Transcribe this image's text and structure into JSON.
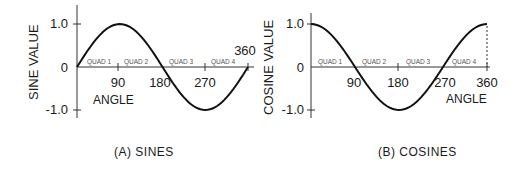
{
  "chart_data": [
    {
      "type": "line",
      "title": "(A) SINES",
      "xlabel": "ANGLE",
      "ylabel": "SINE VALUE",
      "x_ticks": [
        "90",
        "180",
        "270",
        "360"
      ],
      "y_ticks": [
        "1.0",
        "0",
        "-1.0"
      ],
      "regions": [
        "QUAD 1",
        "QUAD 2",
        "QUAD 3",
        "QUAD 4"
      ],
      "x": [
        0,
        45,
        90,
        135,
        180,
        225,
        270,
        315,
        360
      ],
      "series": [
        {
          "name": "sin",
          "values": [
            0,
            0.707,
            1,
            0.707,
            0,
            -0.707,
            -1,
            -0.707,
            0
          ]
        }
      ],
      "xlim": [
        0,
        360
      ],
      "ylim": [
        -1,
        1
      ],
      "grid": false
    },
    {
      "type": "line",
      "title": "(B) COSINES",
      "xlabel": "ANGLE",
      "ylabel": "COSINE VALUE",
      "x_ticks": [
        "90",
        "180",
        "270",
        "360"
      ],
      "y_ticks": [
        "1.0",
        "0",
        "-1.0"
      ],
      "regions": [
        "QUAD 1",
        "QUAD 2",
        "QUAD 3",
        "QUAD 4"
      ],
      "x": [
        0,
        45,
        90,
        135,
        180,
        225,
        270,
        315,
        360
      ],
      "series": [
        {
          "name": "cos",
          "values": [
            1,
            0.707,
            0,
            -0.707,
            -1,
            -0.707,
            0,
            0.707,
            1
          ]
        }
      ],
      "xlim": [
        0,
        360
      ],
      "ylim": [
        -1,
        1
      ],
      "grid": false
    }
  ],
  "sine": {
    "ylabel": "SINE VALUE",
    "y_top": "1.0",
    "y_zero": "0",
    "y_bottom": "-1.0",
    "t90": "90",
    "t180": "180",
    "t270": "270",
    "t360": "360",
    "xlabel": "ANGLE",
    "q1": "QUAD 1",
    "q2": "QUAD 2",
    "q3": "QUAD 3",
    "q4": "QUAD 4",
    "caption": "(A) SINES"
  },
  "cosine": {
    "ylabel": "COSINE VALUE",
    "y_top": "1.0",
    "y_zero": "0",
    "y_bottom": "-1.0",
    "t90": "90",
    "t180": "180",
    "t270": "270",
    "t360": "360",
    "xlabel": "ANGLE",
    "q1": "QUAD 1",
    "q2": "QUAD 2",
    "q3": "QUAD 3",
    "q4": "QUAD 4",
    "caption": "(B) COSINES"
  }
}
